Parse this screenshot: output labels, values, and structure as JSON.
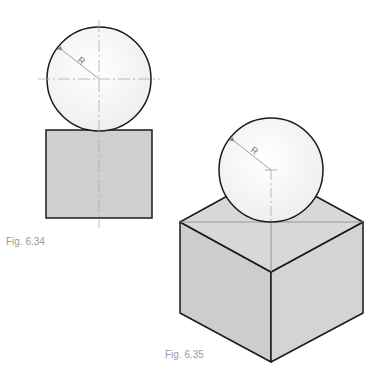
{
  "figures": [
    {
      "id": "fig-6-34",
      "caption": "Fig. 6.34",
      "view": "orthographic",
      "sphere_label": "R",
      "shapes": {
        "sphere": "circle",
        "base": "square"
      }
    },
    {
      "id": "fig-6-35",
      "caption": "Fig. 6.35",
      "view": "isometric",
      "sphere_label": "R",
      "shapes": {
        "sphere": "circle",
        "base": "cube"
      }
    }
  ],
  "colors": {
    "outline": "#1a1a1a",
    "fill_box": "#cfcfcf",
    "fill_box_top": "#d8d8d8",
    "fill_box_right": "#d3d3d3",
    "fill_sphere": "#f4f4f4",
    "centerline": "#aaaaaa",
    "caption": "#9a9a9a"
  }
}
